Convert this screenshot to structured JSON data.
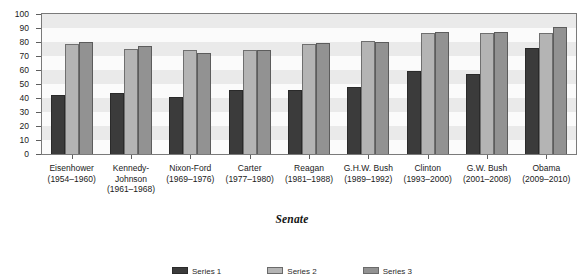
{
  "chart_data": {
    "type": "bar",
    "title": "",
    "xlabel": "Senate",
    "ylabel": "",
    "ylim": [
      0,
      100
    ],
    "yticks": [
      0,
      10,
      20,
      30,
      40,
      50,
      60,
      70,
      80,
      90,
      100
    ],
    "grid": "horizontal-bands",
    "legend_position": "bottom",
    "categories": [
      "Eisenhower (1954–1960)",
      "Kennedy–Johnson (1961–1968)",
      "Nixon-Ford (1969–1976)",
      "Carter (1977–1980)",
      "Reagan (1981–1988)",
      "G.H.W. Bush (1989–1992)",
      "Clinton (1993–2000)",
      "G.W. Bush (2001–2008)",
      "Obama (2009–2010)"
    ],
    "category_parts": [
      {
        "name": "Eisenhower",
        "years": "(1954–1960)"
      },
      {
        "name": "Kennedy-",
        "name2": "Johnson",
        "years": "(1961–1968)"
      },
      {
        "name": "Nixon-Ford",
        "years": "(1969–1976)"
      },
      {
        "name": "Carter",
        "years": "(1977–1980)"
      },
      {
        "name": "Reagan",
        "years": "(1981–1988)"
      },
      {
        "name": "G.H.W. Bush",
        "years": "(1989–1992)"
      },
      {
        "name": "Clinton",
        "years": "(1993–2000)"
      },
      {
        "name": "G.W. Bush",
        "years": "(2001–2008)"
      },
      {
        "name": "Obama",
        "years": "(2009–2010)"
      }
    ],
    "series": [
      {
        "name": "Series 1",
        "color": "#3b3b3b",
        "values": [
          42.5,
          43.5,
          41.0,
          45.5,
          45.5,
          48.0,
          59.0,
          57.0,
          75.5
        ]
      },
      {
        "name": "Series 2",
        "color": "#b4b4b4",
        "values": [
          78.5,
          75.0,
          74.0,
          74.5,
          78.5,
          80.5,
          86.5,
          86.5,
          86.5
        ]
      },
      {
        "name": "Series 3",
        "color": "#929292",
        "values": [
          80.0,
          77.0,
          72.5,
          74.5,
          79.5,
          80.0,
          87.0,
          87.0,
          90.5
        ]
      }
    ]
  },
  "colors": {
    "series_1": "#3b3b3b",
    "series_2": "#b4b4b4",
    "series_3": "#929292",
    "plot_background": "#f2f2f2",
    "band_light": "#fbfbfb",
    "band_dark": "#eaeaea",
    "axis_line": "#7a7a7a",
    "text": "#1a1a1a"
  }
}
